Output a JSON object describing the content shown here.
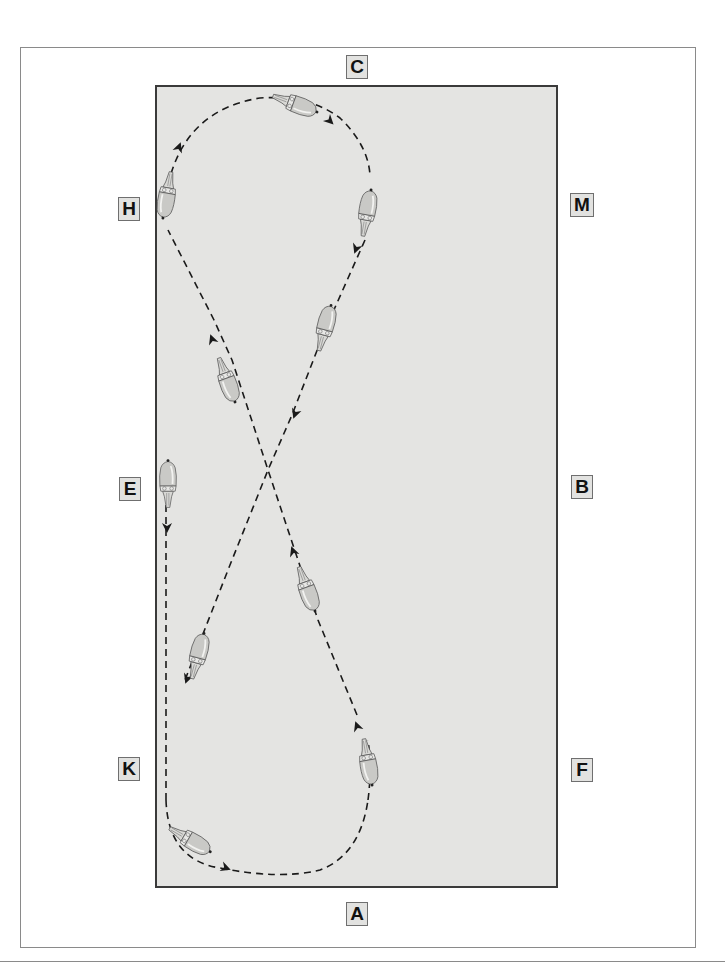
{
  "diagram": {
    "type": "dressage-arena-figure-eight",
    "colors": {
      "arena_fill": "#e4e4e2",
      "arena_border": "#3a3a3a",
      "frame_border": "#8a8a8a",
      "path": "#1a1a1a",
      "marker_fill": "#e2e2e0",
      "horse_body": "#c9c9c6"
    },
    "markers": [
      {
        "id": "C",
        "label": "C",
        "position": "top-center"
      },
      {
        "id": "H",
        "label": "H",
        "position": "left-upper"
      },
      {
        "id": "M",
        "label": "M",
        "position": "right-upper"
      },
      {
        "id": "E",
        "label": "E",
        "position": "left-middle"
      },
      {
        "id": "B",
        "label": "B",
        "position": "right-middle"
      },
      {
        "id": "K",
        "label": "K",
        "position": "left-lower"
      },
      {
        "id": "F",
        "label": "F",
        "position": "right-lower"
      },
      {
        "id": "A",
        "label": "A",
        "position": "bottom-center"
      }
    ],
    "path": {
      "style": "dashed",
      "shape": "figure-eight with directional arrows",
      "route": "E → K → around A → up diagonal through X → circle near C → down diagonal through X → ends near K"
    },
    "horses": [
      {
        "id": "h1",
        "near": "top loop at C",
        "heading": "right"
      },
      {
        "id": "h2",
        "near": "H",
        "heading": "up"
      },
      {
        "id": "h3",
        "near": "M",
        "heading": "down"
      },
      {
        "id": "h4",
        "near": "upper right diagonal",
        "heading": "down-left"
      },
      {
        "id": "h5",
        "near": "upper left diagonal",
        "heading": "up-left"
      },
      {
        "id": "h6",
        "near": "E",
        "heading": "down"
      },
      {
        "id": "h7",
        "near": "lower right diagonal",
        "heading": "up-left"
      },
      {
        "id": "h8",
        "near": "lower left diagonal",
        "heading": "down-left"
      },
      {
        "id": "h9",
        "near": "F",
        "heading": "up"
      },
      {
        "id": "h10",
        "near": "bottom loop at A",
        "heading": "right"
      }
    ]
  }
}
